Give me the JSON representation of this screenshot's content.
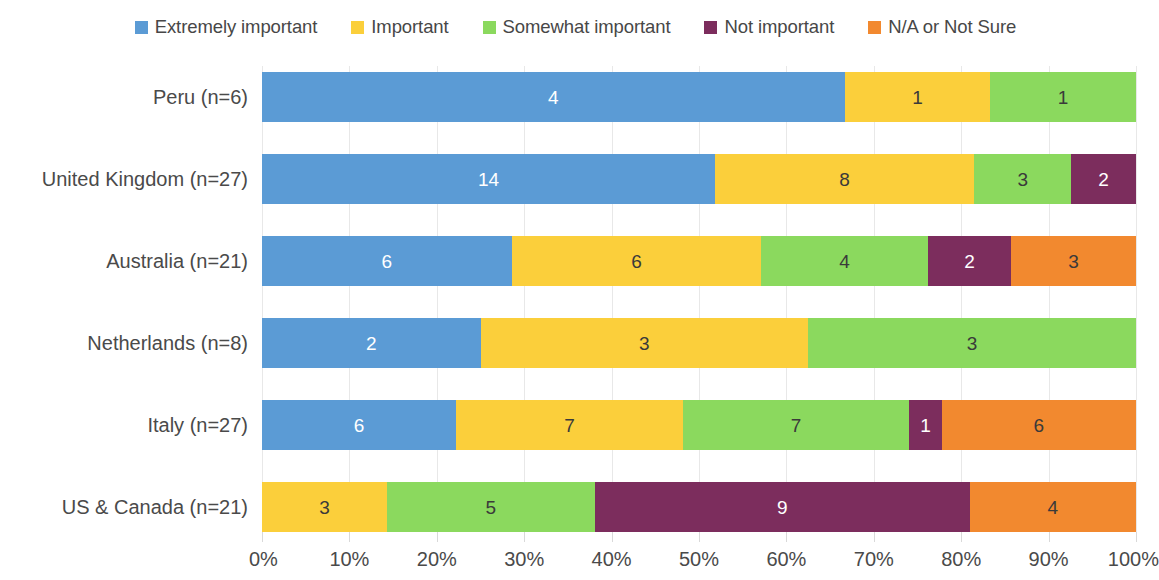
{
  "legend": {
    "position": "top-center",
    "items": [
      {
        "label": "Extremely important",
        "color": "#5B9BD5",
        "icon": "square-swatch-icon"
      },
      {
        "label": "Important",
        "color": "#FBCF3B",
        "icon": "square-swatch-icon"
      },
      {
        "label": "Somewhat important",
        "color": "#8BD95E",
        "icon": "square-swatch-icon"
      },
      {
        "label": "Not important",
        "color": "#7C2D5D",
        "icon": "square-swatch-icon"
      },
      {
        "label": "N/A or Not Sure",
        "color": "#F2892F",
        "icon": "square-swatch-icon"
      }
    ]
  },
  "axis": {
    "x_ticks": [
      "0%",
      "10%",
      "20%",
      "30%",
      "40%",
      "50%",
      "60%",
      "70%",
      "80%",
      "90%",
      "100%"
    ],
    "x_min": 0,
    "x_max": 100,
    "grid": true
  },
  "chart_data": {
    "type": "bar",
    "orientation": "horizontal",
    "stacked": true,
    "normalized": true,
    "title": "",
    "subtitle": "",
    "xlabel": "",
    "ylabel": "",
    "xlim": [
      0,
      100
    ],
    "grid": true,
    "legend_position": "top-center",
    "categories": [
      "Peru (n=6)",
      "United Kingdom (n=27)",
      "Australia (n=21)",
      "Netherlands (n=8)",
      "Italy (n=27)",
      "US & Canada (n=21)"
    ],
    "category_totals": [
      6,
      27,
      21,
      8,
      27,
      21
    ],
    "series": [
      {
        "name": "Extremely important",
        "color": "#5B9BD5",
        "values": [
          4,
          14,
          6,
          2,
          6,
          0
        ]
      },
      {
        "name": "Important",
        "color": "#FBCF3B",
        "values": [
          1,
          8,
          6,
          3,
          7,
          3
        ]
      },
      {
        "name": "Somewhat important",
        "color": "#8BD95E",
        "values": [
          1,
          3,
          4,
          3,
          7,
          5
        ]
      },
      {
        "name": "Not important",
        "color": "#7C2D5D",
        "values": [
          0,
          2,
          2,
          0,
          1,
          9
        ]
      },
      {
        "name": "N/A or Not Sure",
        "color": "#F2892F",
        "values": [
          0,
          0,
          3,
          0,
          6,
          4
        ]
      }
    ],
    "percent_series": [
      {
        "name": "Extremely important",
        "values": [
          66.7,
          51.9,
          28.6,
          25.0,
          22.2,
          0.0
        ]
      },
      {
        "name": "Important",
        "values": [
          16.7,
          29.6,
          28.6,
          37.5,
          25.9,
          14.3
        ]
      },
      {
        "name": "Somewhat important",
        "values": [
          16.7,
          11.1,
          19.0,
          37.5,
          25.9,
          23.8
        ]
      },
      {
        "name": "Not important",
        "values": [
          0.0,
          7.4,
          9.5,
          0.0,
          3.7,
          42.9
        ]
      },
      {
        "name": "N/A or Not Sure",
        "values": [
          0.0,
          0.0,
          14.3,
          0.0,
          22.2,
          19.0
        ]
      }
    ],
    "bar_labels": {
      "Peru (n=6)": [
        "4",
        "1",
        "1",
        "",
        ""
      ],
      "United Kingdom (n=27)": [
        "14",
        "8",
        "3",
        "2",
        ""
      ],
      "Australia (n=21)": [
        "6",
        "6",
        "4",
        "2",
        "3"
      ],
      "Netherlands (n=8)": [
        "2",
        "3",
        "3",
        "",
        ""
      ],
      "Italy (n=27)": [
        "6",
        "7",
        "7",
        "1",
        "6"
      ],
      "US & Canada (n=21)": [
        "",
        "3",
        "5",
        "9",
        "4"
      ]
    }
  }
}
